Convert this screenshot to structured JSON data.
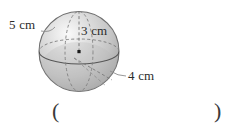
{
  "figure": {
    "type": "sphere-diagram",
    "shape": "sphere",
    "sphere": {
      "center_x": 79,
      "center_y": 51.5,
      "radius": 40,
      "fill_light": "#f2f2f2",
      "fill_mid": "#c9c9c9",
      "fill_dark": "#a8a8a8",
      "outline_color": "#6e6e6e"
    },
    "guides": {
      "equator_front_style": "solid",
      "equator_back_style": "dashed",
      "meridian_style": "dashed",
      "radius_line_style": "dashed",
      "chord_line_style": "dashed",
      "line_color": "#7a7a7a"
    },
    "center_point": {
      "label": "center-dot",
      "color": "#1a1a1a"
    }
  },
  "labels": {
    "slant": "5 cm",
    "height": "3 cm",
    "base": "4 cm"
  },
  "answer_field": {
    "open_paren": "(",
    "close_paren": ")",
    "value": ""
  }
}
